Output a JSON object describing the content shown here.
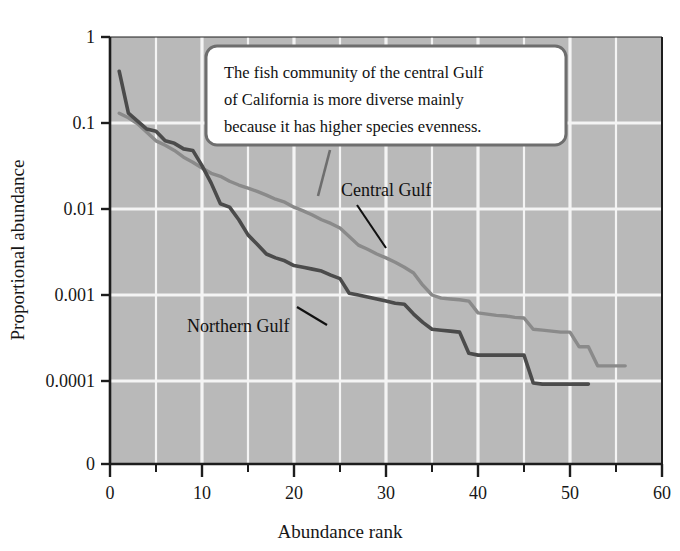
{
  "figure": {
    "background_color": "#ffffff",
    "plot_background_color": "#b9b9b9",
    "gridline_color": "#f4f4f4",
    "axis_color": "#1d1d1d"
  },
  "annotation": {
    "callout_line1": "The fish community of the central Gulf",
    "callout_line2": "of California is more diverse mainly",
    "callout_line3": "because it has higher species evenness.",
    "callout_border_color": "#6e6e6e",
    "callout_fill_color": "#ffffff"
  },
  "series_labels": {
    "central": "Central Gulf",
    "northern": "Northern Gulf"
  },
  "chart_data": {
    "type": "line",
    "title": "",
    "xlabel": "Abundance rank",
    "ylabel": "Proportional abundance",
    "yscale": "log",
    "ylim": [
      0.0001,
      1
    ],
    "xlim": [
      0,
      60
    ],
    "ytick_labels": [
      "1",
      "0.1",
      "0.01",
      "0.001",
      "0.0001",
      "0"
    ],
    "ytick_values": [
      1,
      0.1,
      0.01,
      0.001,
      0.0001,
      0
    ],
    "xtick_labels": [
      "0",
      "10",
      "20",
      "30",
      "40",
      "50",
      "60"
    ],
    "xtick_values": [
      0,
      10,
      20,
      30,
      40,
      50,
      60
    ],
    "xminor_tick_values": [
      5,
      15,
      25,
      35,
      45,
      55
    ],
    "grid": true,
    "legend_position": "inline-annotation",
    "series": [
      {
        "name": "Northern Gulf",
        "color": "#4b4b4b",
        "x": [
          1,
          2,
          3,
          4,
          5,
          6,
          7,
          8,
          9,
          10,
          11,
          12,
          13,
          14,
          15,
          16,
          17,
          18,
          19,
          20,
          21,
          22,
          23,
          24,
          25,
          26,
          27,
          28,
          29,
          30,
          31,
          32,
          33,
          34,
          35,
          36,
          37,
          38,
          39,
          40,
          41,
          42,
          43,
          44,
          45,
          46,
          47,
          48,
          49,
          50,
          51,
          52
        ],
        "values": [
          0.4,
          0.13,
          0.105,
          0.085,
          0.08,
          0.062,
          0.058,
          0.05,
          0.048,
          0.032,
          0.02,
          0.0115,
          0.0105,
          0.0075,
          0.005,
          0.0039,
          0.003,
          0.0027,
          0.0025,
          0.0022,
          0.0021,
          0.002,
          0.0019,
          0.0017,
          0.00155,
          0.00105,
          0.001,
          0.00095,
          0.0009,
          0.00085,
          0.0008,
          0.00078,
          0.0006,
          0.00048,
          0.0004,
          0.00039,
          0.00038,
          0.00037,
          0.00021,
          0.0002,
          0.0002,
          0.0002,
          0.0002,
          0.0002,
          0.0002,
          9.5e-05,
          9.2e-05,
          9.2e-05,
          9.2e-05,
          9.2e-05,
          9.2e-05,
          9.2e-05
        ]
      },
      {
        "name": "Central Gulf",
        "color": "#8a8a8a",
        "x": [
          1,
          2,
          3,
          4,
          5,
          6,
          7,
          8,
          9,
          10,
          11,
          12,
          13,
          14,
          15,
          16,
          17,
          18,
          19,
          20,
          21,
          22,
          23,
          24,
          25,
          26,
          27,
          28,
          29,
          30,
          31,
          32,
          33,
          34,
          35,
          36,
          37,
          38,
          39,
          40,
          41,
          42,
          43,
          44,
          45,
          46,
          47,
          48,
          49,
          50,
          51,
          52,
          53,
          54,
          55,
          56
        ],
        "values": [
          0.13,
          0.115,
          0.098,
          0.078,
          0.062,
          0.055,
          0.048,
          0.04,
          0.035,
          0.03,
          0.026,
          0.024,
          0.021,
          0.019,
          0.0175,
          0.016,
          0.0145,
          0.013,
          0.012,
          0.0105,
          0.0095,
          0.0085,
          0.0075,
          0.0068,
          0.006,
          0.0048,
          0.0038,
          0.0034,
          0.003,
          0.0027,
          0.0024,
          0.0021,
          0.0018,
          0.0013,
          0.001,
          0.00092,
          0.0009,
          0.00088,
          0.00085,
          0.00062,
          0.0006,
          0.00058,
          0.00057,
          0.00055,
          0.00054,
          0.0004,
          0.00039,
          0.00038,
          0.00037,
          0.00037,
          0.00025,
          0.00025,
          0.00015,
          0.00015,
          0.00015,
          0.00015
        ]
      }
    ]
  }
}
